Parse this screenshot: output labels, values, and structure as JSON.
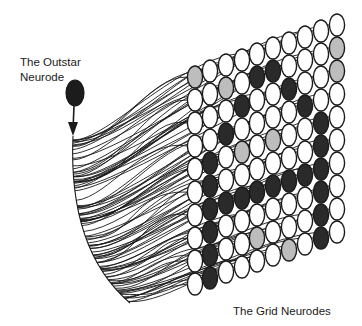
{
  "labels": {
    "outstar_line1": "The Outstar",
    "outstar_line2": "Neurode",
    "grid": "The Grid Neurodes"
  },
  "colors": {
    "stroke": "#1a1a1a",
    "white": "#ffffff",
    "light": "#bdbdbd",
    "dark": "#2a2a2a",
    "outstar_fill": "#1c1c1c"
  },
  "outstar": {
    "cx": 75,
    "cy": 93,
    "rx": 9,
    "ry": 13,
    "arrow_from_y": 106,
    "arrow_to_y": 136
  },
  "grid": {
    "rows": 10,
    "cols": 10,
    "col_x": [
      195,
      210,
      226,
      242,
      257,
      273,
      289,
      305,
      321,
      337
    ],
    "col_top_y": [
      77,
      71,
      65,
      60,
      54,
      48,
      43,
      37,
      31,
      25
    ],
    "row_step": 23,
    "cell_rx": 7.6,
    "cell_ry": 11,
    "legend": {
      "0": "white",
      "1": "light",
      "2": "dark"
    },
    "states": [
      [
        1,
        0,
        0,
        0,
        0,
        0,
        0,
        0,
        0,
        0
      ],
      [
        0,
        0,
        1,
        0,
        2,
        2,
        0,
        0,
        0,
        1
      ],
      [
        0,
        0,
        0,
        2,
        0,
        0,
        2,
        0,
        0,
        1
      ],
      [
        0,
        0,
        2,
        0,
        0,
        0,
        0,
        2,
        0,
        0
      ],
      [
        0,
        2,
        0,
        1,
        0,
        1,
        0,
        0,
        2,
        0
      ],
      [
        0,
        2,
        0,
        0,
        0,
        0,
        0,
        0,
        2,
        0
      ],
      [
        0,
        2,
        2,
        2,
        2,
        2,
        2,
        2,
        2,
        0
      ],
      [
        0,
        2,
        0,
        0,
        0,
        0,
        0,
        0,
        2,
        0
      ],
      [
        0,
        2,
        0,
        0,
        1,
        0,
        0,
        0,
        2,
        0
      ],
      [
        0,
        2,
        0,
        0,
        0,
        0,
        1,
        0,
        2,
        0
      ]
    ]
  },
  "connections": {
    "trunk_start": [
      73,
      136
    ],
    "trunk_end": [
      130,
      303
    ],
    "count": 100
  }
}
